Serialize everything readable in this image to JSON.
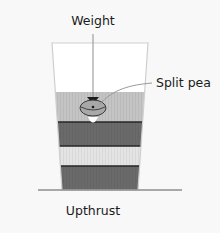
{
  "diagram": {
    "title_labels": {
      "weight": "Weight",
      "split_pea": "Split pea",
      "upthrust": "Upthrust"
    },
    "background_color": "#f8f8f8",
    "text_color": "#1b1b1b",
    "container": {
      "name": "tapered-glass-beaker",
      "outline_color": "#cfcfcf",
      "top_left_x": 52,
      "top_right_x": 148,
      "bottom_left_x": 62,
      "bottom_right_x": 138,
      "top_y": 43,
      "bottom_y": 190
    },
    "layers": [
      {
        "name": "air-gap",
        "color": "#ffffff",
        "top_y": 43,
        "bottom_y": 92,
        "shaded": false
      },
      {
        "name": "liquid-top-band",
        "color": "#c4c4c4",
        "top_y": 92,
        "bottom_y": 122,
        "shaded": true
      },
      {
        "name": "dark-band-upper",
        "color": "#6a6a6a",
        "top_y": 122,
        "bottom_y": 146,
        "shaded": true
      },
      {
        "name": "light-band-middle",
        "color": "#e4e4e4",
        "top_y": 146,
        "bottom_y": 166,
        "shaded": true
      },
      {
        "name": "dark-band-lower",
        "color": "#6a6a6a",
        "top_y": 166,
        "bottom_y": 190,
        "shaded": true
      }
    ],
    "pea": {
      "name": "split-pea",
      "center_x": 93,
      "center_y": 108,
      "radius_x": 13,
      "radius_y": 8,
      "fill_color": "#a8a8a8",
      "stroke_color": "#3a3a3a",
      "bubble_color": "#ffffff"
    },
    "weight_arrow": {
      "name": "weight-force-arrow",
      "from_x": 93,
      "from_y": 34,
      "to_x": 93,
      "to_y": 104,
      "color": "#8e8e8e",
      "head_color": "#1b1b1b"
    },
    "leader_line": {
      "name": "split-pea-leader-line",
      "color": "#9a9a9a",
      "from_x": 152,
      "from_y": 83,
      "to_x": 99,
      "to_y": 105
    },
    "base_line": {
      "name": "support-surface-line",
      "color": "#8e8e8e",
      "x1": 38,
      "x2": 182,
      "y": 190
    },
    "label_positions": {
      "weight": {
        "x": 93,
        "y": 25
      },
      "split_pea": {
        "x": 156,
        "y": 87
      },
      "upthrust": {
        "x": 93,
        "y": 215
      }
    }
  }
}
